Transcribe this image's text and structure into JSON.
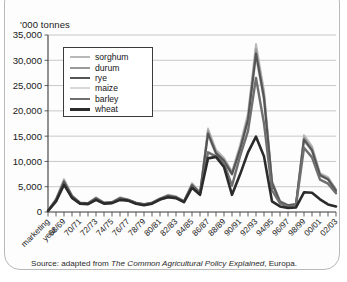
{
  "card": {
    "axis_title": "'000 tonnes",
    "source_prefix": "Source: adapted from ",
    "source_title": "The Common Agricultural Policy Explained",
    "source_suffix": ", Europa."
  },
  "legend": {
    "position": "inside-top-left",
    "items": [
      {
        "label": "sorghum",
        "color": "#b9b9b9",
        "width": 2.0
      },
      {
        "label": "durum",
        "color": "#9a9a9a",
        "width": 2.0
      },
      {
        "label": "rye",
        "color": "#555555",
        "width": 2.2
      },
      {
        "label": "maize",
        "color": "#d8d8d8",
        "width": 2.0
      },
      {
        "label": "barley",
        "color": "#6f6f6f",
        "width": 2.4
      },
      {
        "label": "wheat",
        "color": "#2b2b2b",
        "width": 2.6
      }
    ]
  },
  "chart_data": {
    "type": "line",
    "title": "",
    "subtitle": "",
    "xlabel": "marketing year",
    "ylabel": "'000 tonnes",
    "ylim": [
      0,
      35000
    ],
    "ytick_step": 5000,
    "ytick_labels": [
      "0",
      "5,000",
      "10,000",
      "15,000",
      "20,000",
      "25,000",
      "30,000",
      "35,000"
    ],
    "grid": true,
    "legend_position": "inside-top-left",
    "x_first_label": "marketing\nyear",
    "x": [
      "66/67",
      "67/68",
      "68/69",
      "69/70",
      "70/71",
      "71/72",
      "72/73",
      "73/74",
      "74/75",
      "75/76",
      "76/77",
      "77/78",
      "78/79",
      "79/80",
      "80/81",
      "81/82",
      "82/83",
      "83/84",
      "84/85",
      "85/86",
      "86/87",
      "87/88",
      "88/89",
      "89/90",
      "90/91",
      "91/92",
      "92/93",
      "93/94",
      "94/95",
      "95/96",
      "96/97",
      "97/98",
      "98/99",
      "99/00",
      "00/01",
      "01/02",
      "02/03"
    ],
    "xtick_labels": [
      "marketing year",
      "68/69",
      "70/71",
      "72/73",
      "74/75",
      "76/77",
      "78/79",
      "80/81",
      "82/83",
      "84/85",
      "86/87",
      "88/89",
      "90/91",
      "92/93",
      "94/95",
      "96/97",
      "98/99",
      "00/01",
      "02/03"
    ],
    "series": [
      {
        "name": "sorghum",
        "color": "#b9b9b9",
        "values": [
          300,
          2600,
          6500,
          3300,
          1900,
          1800,
          2900,
          1900,
          2000,
          2900,
          2500,
          1900,
          1600,
          1900,
          2700,
          3400,
          3100,
          2200,
          5700,
          3900,
          16500,
          12300,
          10700,
          8000,
          13200,
          19500,
          33200,
          24000,
          6200,
          2200,
          1400,
          1600,
          15200,
          13000,
          7700,
          6900,
          4500
        ]
      },
      {
        "name": "durum",
        "color": "#9a9a9a",
        "values": [
          280,
          2500,
          6200,
          3200,
          1850,
          1750,
          2800,
          1850,
          1950,
          2800,
          2450,
          1850,
          1550,
          1850,
          2650,
          3300,
          3000,
          2150,
          5500,
          3800,
          16000,
          11900,
          10400,
          7700,
          12700,
          18800,
          32200,
          23200,
          5900,
          2100,
          1350,
          1550,
          14700,
          12600,
          7450,
          6650,
          4350
        ]
      },
      {
        "name": "rye",
        "color": "#555555",
        "values": [
          260,
          2400,
          6000,
          3100,
          1800,
          1700,
          2700,
          1800,
          1900,
          2700,
          2400,
          1800,
          1500,
          1800,
          2600,
          3200,
          2900,
          2100,
          5300,
          3700,
          15500,
          11600,
          10100,
          7500,
          12300,
          18200,
          31300,
          22500,
          5700,
          2000,
          1300,
          1500,
          14300,
          12200,
          7250,
          6450,
          4200
        ]
      },
      {
        "name": "maize",
        "color": "#d8d8d8",
        "values": [
          240,
          2300,
          5800,
          3000,
          1750,
          1650,
          2600,
          1750,
          1850,
          2600,
          2350,
          1750,
          1450,
          1750,
          2550,
          3100,
          2850,
          2050,
          5200,
          3600,
          15000,
          11300,
          9900,
          7300,
          12000,
          17700,
          30500,
          21800,
          5500,
          1950,
          1250,
          1450,
          14000,
          11900,
          7100,
          6300,
          4100
        ]
      },
      {
        "name": "barley",
        "color": "#6f6f6f",
        "values": [
          220,
          2200,
          5600,
          2900,
          1700,
          1600,
          2500,
          1700,
          1800,
          2500,
          2300,
          1700,
          1400,
          1700,
          2500,
          3000,
          2800,
          2000,
          5000,
          3500,
          11800,
          11000,
          9600,
          5200,
          11000,
          16000,
          26500,
          17500,
          4300,
          1700,
          1100,
          1300,
          12700,
          10800,
          6400,
          5600,
          3700
        ]
      },
      {
        "name": "wheat",
        "color": "#2b2b2b",
        "values": [
          200,
          2100,
          5400,
          2800,
          1650,
          1550,
          2400,
          1650,
          1750,
          2400,
          2250,
          1650,
          1350,
          1650,
          2450,
          2900,
          2750,
          1950,
          4800,
          3400,
          10600,
          10900,
          8900,
          3400,
          7400,
          11800,
          14900,
          11000,
          2100,
          1100,
          800,
          900,
          3900,
          3800,
          2500,
          1500,
          1100
        ]
      }
    ]
  }
}
